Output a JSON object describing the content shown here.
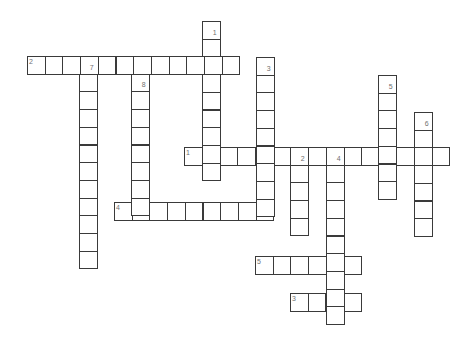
{
  "puzzle": {
    "type": "crossword",
    "cell_size": 17.7,
    "colors": {
      "background": "#ffffff",
      "grid_line": "#3a3a3a",
      "number": "#707070"
    },
    "words": [
      {
        "number": "2",
        "direction": "across",
        "x": 27,
        "y": 56,
        "length": 12,
        "label_pos": "top-left"
      },
      {
        "number": "1",
        "direction": "across",
        "x": 184,
        "y": 147,
        "length": 15,
        "label_pos": "top-left"
      },
      {
        "number": "4",
        "direction": "across",
        "x": 114,
        "y": 202,
        "length": 9,
        "label_pos": "top-left"
      },
      {
        "number": "5",
        "direction": "across",
        "x": 255,
        "y": 256,
        "length": 6,
        "label_pos": "top-left"
      },
      {
        "number": "3",
        "direction": "across",
        "x": 290,
        "y": 293,
        "length": 4,
        "label_pos": "top-left"
      },
      {
        "number": "1",
        "direction": "down",
        "x": 202,
        "y": 21,
        "length": 9,
        "label_pos": "bottom-right"
      },
      {
        "number": "3",
        "direction": "down",
        "x": 256,
        "y": 57,
        "length": 9,
        "label_pos": "bottom-right"
      },
      {
        "number": "7",
        "direction": "down",
        "x": 79,
        "y": 56,
        "length": 12,
        "label_pos": "bottom-right"
      },
      {
        "number": "8",
        "direction": "down",
        "x": 131,
        "y": 56,
        "length": 9,
        "label_pos": "below-first"
      },
      {
        "number": "5",
        "direction": "down",
        "x": 378,
        "y": 75,
        "length": 7,
        "label_pos": "bottom-right"
      },
      {
        "number": "6",
        "direction": "down",
        "x": 414,
        "y": 112,
        "length": 7,
        "label_pos": "bottom-right"
      },
      {
        "number": "2",
        "direction": "down",
        "x": 290,
        "y": 147,
        "length": 5,
        "label_pos": "bottom-right"
      },
      {
        "number": "4",
        "direction": "down",
        "x": 326,
        "y": 147,
        "length": 10,
        "label_pos": "bottom-right"
      }
    ]
  }
}
